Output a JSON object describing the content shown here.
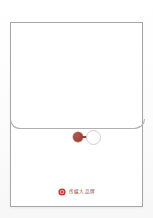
{
  "scene": {
    "subject": "paper-document-envelope",
    "background_color": "#fdfdfd",
    "envelope_color": "#ffffff",
    "envelope_border_color": "#a6a6a6",
    "flap_line_color": "#b0b0b0"
  },
  "envelope": {
    "flap": {
      "label": "",
      "edge_color": "#b0b0b0"
    },
    "clasp": {
      "button_label": "",
      "button_color": "#a0453b",
      "string_color": "#9c4339",
      "ring_color": "#cfcfcf",
      "icon_name": "string-button-clasp"
    }
  },
  "brand": {
    "seal_icon_name": "red-seal-flower-icon",
    "seal_color": "#c4322a",
    "seal_inner_color": "#e4a09a",
    "name": "传媒大品牌",
    "name_color": "#8f4a44"
  }
}
